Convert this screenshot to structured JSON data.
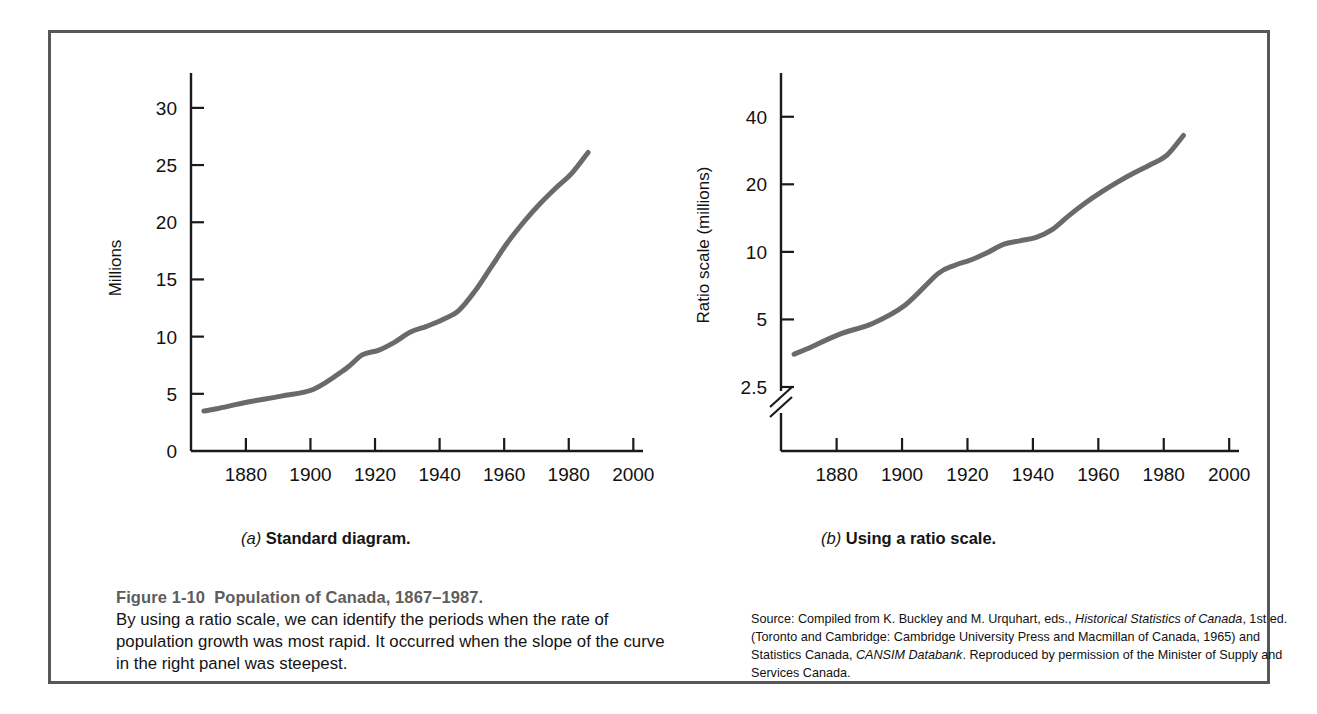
{
  "figure": {
    "title_number": "Figure 1-10",
    "title_text": "Population of Canada, 1867–1987.",
    "body": "By using a ratio scale, we can identify the periods when the rate of population growth was most rapid. It occurred when the slope of the curve in the right panel was steepest.",
    "source_prefix": "Source: Compiled from K. Buckley and M. Urquhart, eds., ",
    "source_italic_1": "Historical Statistics of Canada",
    "source_mid": ", 1st ed. (Toronto and Cambridge: Cambridge University Press and Macmillan of Canada, 1965) and Statistics Canada, ",
    "source_italic_2": "CANSIM Databank",
    "source_suffix": ". Reproduced by permission of the Minister of Supply and Services Canada."
  },
  "panel_a": {
    "letter": "(a)",
    "caption": "Standard diagram.",
    "ylabel": "Millions"
  },
  "panel_b": {
    "letter": "(b)",
    "caption": "Using a ratio scale.",
    "ylabel": "Ratio scale (millions)"
  },
  "colors": {
    "frame": "#575757",
    "axis": "#1a1a1a",
    "curve": "#6a6a6a",
    "caption_gray": "#5d5d5d",
    "text": "#121212"
  },
  "chart_data": [
    {
      "type": "line",
      "title": "(a) Standard diagram.",
      "xlabel": "",
      "ylabel": "Millions",
      "xlim": [
        1863,
        2003
      ],
      "ylim": [
        0,
        32
      ],
      "yscale": "linear",
      "grid": false,
      "legend": "none",
      "xticks": [
        1880,
        1900,
        1920,
        1940,
        1960,
        1980,
        2000
      ],
      "yticks": [
        0,
        5,
        10,
        15,
        20,
        25,
        30
      ],
      "x": [
        1867,
        1871,
        1881,
        1891,
        1901,
        1911,
        1916,
        1921,
        1926,
        1931,
        1936,
        1941,
        1946,
        1951,
        1956,
        1961,
        1966,
        1971,
        1976,
        1981,
        1986
      ],
      "values": [
        3.5,
        3.7,
        4.3,
        4.8,
        5.4,
        7.2,
        8.4,
        8.8,
        9.5,
        10.4,
        10.9,
        11.5,
        12.3,
        14.0,
        16.1,
        18.2,
        20.0,
        21.6,
        23.0,
        24.3,
        26.1
      ]
    },
    {
      "type": "line",
      "title": "(b) Using a ratio scale.",
      "xlabel": "",
      "ylabel": "Ratio scale (millions)",
      "xlim": [
        1863,
        2003
      ],
      "ylim": [
        2.2,
        50
      ],
      "yscale": "log",
      "axis_break": true,
      "grid": false,
      "legend": "none",
      "xticks": [
        1880,
        1900,
        1920,
        1940,
        1960,
        1980,
        2000
      ],
      "yticks": [
        2.5,
        5,
        10,
        20,
        40
      ],
      "x": [
        1867,
        1871,
        1881,
        1891,
        1901,
        1911,
        1916,
        1921,
        1926,
        1931,
        1936,
        1941,
        1946,
        1951,
        1956,
        1961,
        1966,
        1971,
        1976,
        1981,
        1986
      ],
      "values": [
        3.5,
        3.7,
        4.3,
        4.8,
        5.8,
        8.0,
        8.7,
        9.2,
        9.9,
        10.8,
        11.2,
        11.6,
        12.6,
        14.5,
        16.5,
        18.5,
        20.5,
        22.5,
        24.5,
        27.0,
        33.0
      ]
    }
  ]
}
